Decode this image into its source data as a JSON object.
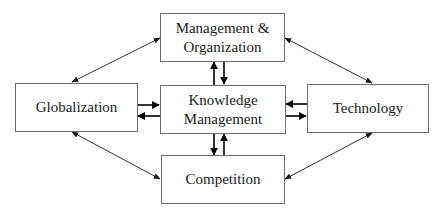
{
  "diagram": {
    "type": "concept-map",
    "nodes": [
      {
        "id": "management",
        "label": "Management &\nOrganization"
      },
      {
        "id": "globalization",
        "label": "Globalization"
      },
      {
        "id": "knowledge",
        "label": "Knowledge\nManagement"
      },
      {
        "id": "technology",
        "label": "Technology"
      },
      {
        "id": "competition",
        "label": "Competition"
      }
    ],
    "edges": [
      {
        "from": "globalization",
        "to": "management",
        "direction": "bidirectional",
        "style": "thin-diagonal"
      },
      {
        "from": "management",
        "to": "technology",
        "direction": "bidirectional",
        "style": "thin-diagonal"
      },
      {
        "from": "globalization",
        "to": "competition",
        "direction": "bidirectional",
        "style": "thin-diagonal"
      },
      {
        "from": "competition",
        "to": "technology",
        "direction": "bidirectional",
        "style": "thin-diagonal"
      },
      {
        "from": "knowledge",
        "to": "management",
        "direction": "one-way",
        "style": "bold-pair"
      },
      {
        "from": "management",
        "to": "knowledge",
        "direction": "one-way",
        "style": "bold-pair"
      },
      {
        "from": "globalization",
        "to": "knowledge",
        "direction": "one-way",
        "style": "bold-pair"
      },
      {
        "from": "knowledge",
        "to": "globalization",
        "direction": "one-way",
        "style": "bold-pair"
      },
      {
        "from": "technology",
        "to": "knowledge",
        "direction": "one-way",
        "style": "bold-pair"
      },
      {
        "from": "knowledge",
        "to": "technology",
        "direction": "one-way",
        "style": "bold-pair"
      },
      {
        "from": "knowledge",
        "to": "competition",
        "direction": "one-way",
        "style": "bold-pair"
      },
      {
        "from": "competition",
        "to": "knowledge",
        "direction": "one-way",
        "style": "bold-pair"
      }
    ],
    "colors": {
      "box_border": "#6e6e6e",
      "text": "#1a1a1a",
      "arrow": "#1a1a1a",
      "background": "#ffffff"
    }
  }
}
